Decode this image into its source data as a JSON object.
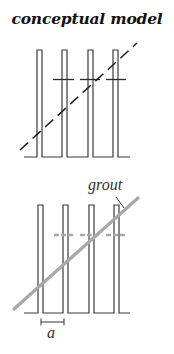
{
  "title": "conceptual model",
  "colors": {
    "line": "#3a3a3a",
    "grout": "#a8a8a8",
    "background": "#ffffff"
  },
  "top_diagram": {
    "pillars": 4,
    "crossbar_style": "solid-dark",
    "diagonal_style": "dashed-dark"
  },
  "bottom_diagram": {
    "pillars": 4,
    "crossbar_style": "dashed-gray",
    "diagonal_style": "solid-gray",
    "labels": {
      "grout": "grout",
      "spacing": "a"
    }
  }
}
